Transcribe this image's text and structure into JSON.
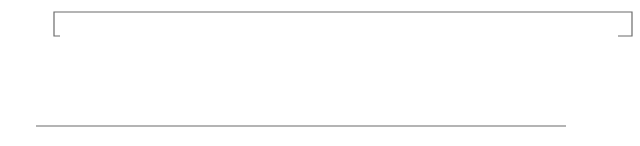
{
  "diagram": {
    "type": "ring-counter",
    "clock_label": "CLK",
    "flip_flops": [
      {
        "name": "FF0",
        "d_label": "D",
        "c_label": "C",
        "q_label": "Q",
        "q_sub": "0"
      },
      {
        "name": "FF1",
        "d_label": "D",
        "c_label": "C",
        "q_label": "Q",
        "q_sub": "1"
      },
      {
        "name": "FF2",
        "d_label": "D",
        "c_label": "C",
        "q_label": "Q",
        "q_sub": "2"
      },
      {
        "name": "FF3",
        "d_label": "D",
        "c_label": "C",
        "q_label": "Q",
        "q_sub": "3"
      },
      {
        "name": "FF4",
        "d_label": "D",
        "c_label": "C",
        "q_label": "Q",
        "q_sub": "4"
      },
      {
        "name": "FF5",
        "d_label": "D",
        "c_label": "C",
        "q_label": "Q",
        "q_sub": "5"
      },
      {
        "name": "FF6",
        "d_label": "D",
        "c_label": "C",
        "q_label": "Q",
        "q_sub": "6"
      },
      {
        "name": "FF7",
        "d_label": "D",
        "c_label": "C",
        "q_label": "Q",
        "q_sub": "7"
      },
      {
        "name": "FF8",
        "d_label": "D",
        "c_label": "C",
        "q_label": "Q",
        "q_sub": "8"
      },
      {
        "name": "FF9",
        "d_label": "D",
        "c_label": "C",
        "q_label": "Q",
        "q_sub": "9"
      }
    ],
    "colors": {
      "box": "#1a1a1a",
      "wire": "#6b6b6b",
      "q_label": "#7a7a7a"
    }
  }
}
